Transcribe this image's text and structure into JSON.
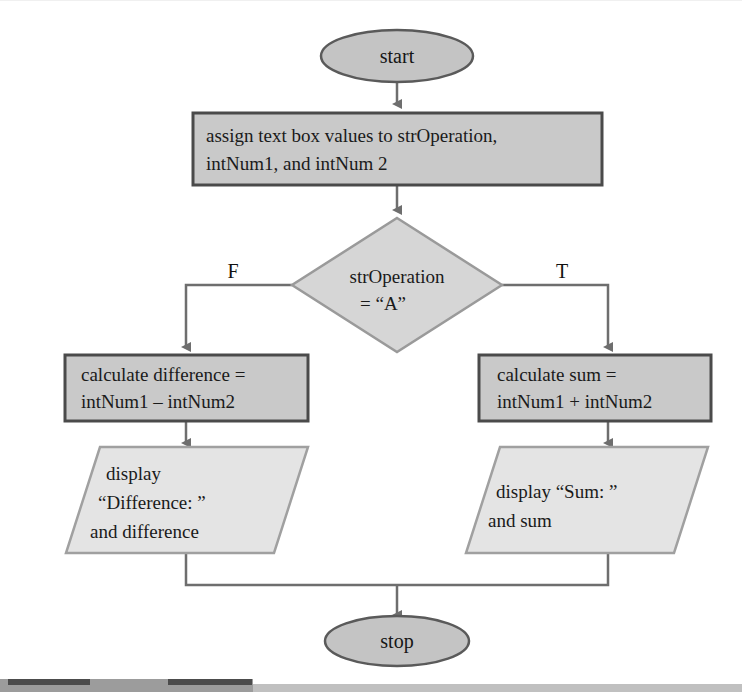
{
  "diagram": {
    "background_color": "#ffffff",
    "palette": {
      "process_fill": "#c9c9c9",
      "process_stroke": "#4a4a4a",
      "terminator_fill": "#c4c4c4",
      "terminator_stroke": "#5a5a5a",
      "decision_fill": "#d6d6d6",
      "decision_stroke": "#9a9a9a",
      "io_fill": "#e4e4e4",
      "io_stroke": "#a0a0a0",
      "connector_color": "#6e6e6e",
      "text_color": "#1a1a1a"
    },
    "nodes": {
      "start": {
        "type": "terminator",
        "label": "start"
      },
      "assign": {
        "type": "process",
        "lines": [
          "assign text box values to strOperation,",
          "intNum1, and intNum 2"
        ]
      },
      "decision": {
        "type": "decision",
        "lines": [
          "strOperation",
          "= “A”"
        ]
      },
      "calc_difference": {
        "type": "process",
        "lines": [
          "calculate difference =",
          "intNum1 – intNum2"
        ]
      },
      "calc_sum": {
        "type": "process",
        "lines": [
          "calculate sum =",
          "intNum1 + intNum2"
        ]
      },
      "display_difference": {
        "type": "input-output",
        "lines": [
          "display",
          "“Difference: ”",
          "and difference"
        ]
      },
      "display_sum": {
        "type": "input-output",
        "lines": [
          "display “Sum: ”",
          "and sum"
        ]
      },
      "stop": {
        "type": "terminator",
        "label": "stop"
      }
    },
    "branch_labels": {
      "false": "F",
      "true": "T"
    },
    "footer_bar": {
      "dark_color": "#4c4c4c",
      "mid_color": "#9c9c9c",
      "light_color": "#c0c0c0"
    }
  }
}
